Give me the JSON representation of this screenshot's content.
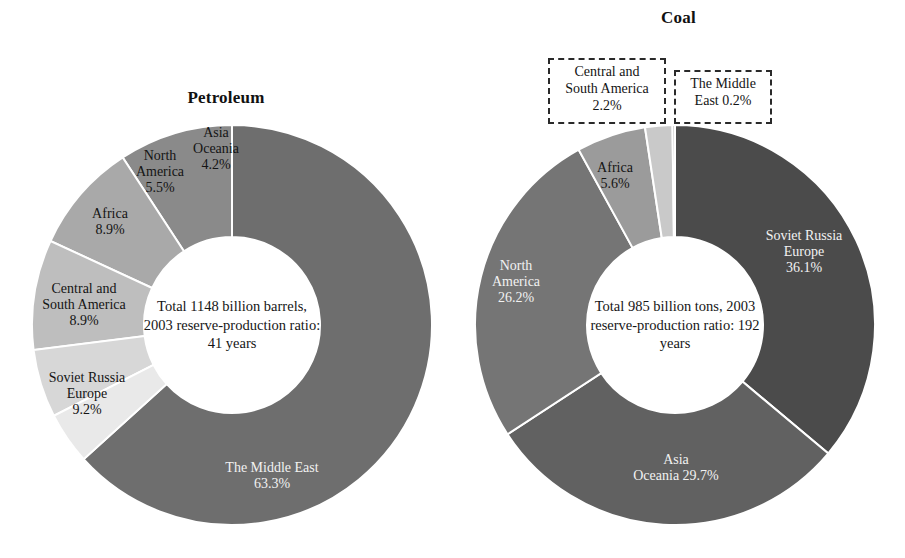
{
  "figure": {
    "background_color": "#ffffff",
    "text_color": "#141414"
  },
  "chart_data": [
    {
      "type": "pie",
      "variant": "donut",
      "title": "Petroleum",
      "unit": "percent of world reserves",
      "center_note": {
        "line1": "Total 1148 billion barrels,",
        "line2": "2003 reserve-production",
        "line3": "ratio: 41 years"
      },
      "total_label": "Total 1148 billion barrels",
      "total_value": 1148,
      "total_unit": "billion barrels",
      "reserve_production_ratio_year": 2003,
      "reserve_production_ratio_years": 41,
      "categories": [
        "The Middle East",
        "Soviet Russia Europe",
        "Central and South America",
        "Africa",
        "North America",
        "Asia Oceania"
      ],
      "values": [
        63.3,
        9.2,
        8.9,
        8.9,
        5.5,
        4.2
      ],
      "slices": [
        {
          "name": "The Middle East",
          "label_line1": "The Middle East",
          "label_line2": "63.3%",
          "value": 63.3,
          "color": "#6e6e6e",
          "label_color": "#f2f2f2"
        },
        {
          "name": "Soviet Russia Europe",
          "label_line1": "Soviet Russia",
          "label_line2": "Europe",
          "label_line3": "9.2%",
          "value": 9.2,
          "color": "#8a8a8a",
          "label_color": "#141414"
        },
        {
          "name": "Central and South America",
          "label_line1": "Central and",
          "label_line2": "South America",
          "label_line3": "8.9%",
          "value": 8.9,
          "color": "#a9a9a9",
          "label_color": "#141414"
        },
        {
          "name": "Africa",
          "label_line1": "Africa",
          "label_line2": "8.9%",
          "value": 8.9,
          "color": "#bebebe",
          "label_color": "#141414"
        },
        {
          "name": "North America",
          "label_line1": "North",
          "label_line2": "America",
          "label_line3": "5.5%",
          "value": 5.5,
          "color": "#d7d7d7",
          "label_color": "#141414"
        },
        {
          "name": "Asia Oceania",
          "label_line1": "Asia",
          "label_line2": "Oceania",
          "label_line3": "4.2%",
          "value": 4.2,
          "color": "#e9e9e9",
          "label_color": "#141414"
        }
      ]
    },
    {
      "type": "pie",
      "variant": "donut",
      "title": "Coal",
      "unit": "percent of world reserves",
      "center_note": {
        "line1": "Total 985 billion tons,",
        "line2": "2003 reserve-production",
        "line3": "ratio: 192 years"
      },
      "total_label": "Total 985 billion tons",
      "total_value": 985,
      "total_unit": "billion tons",
      "reserve_production_ratio_year": 2003,
      "reserve_production_ratio_years": 192,
      "categories": [
        "Soviet Russia Europe",
        "Asia Oceania",
        "North America",
        "Africa",
        "Central and South America",
        "The Middle East"
      ],
      "values": [
        36.1,
        29.7,
        26.2,
        5.6,
        2.2,
        0.2
      ],
      "slices": [
        {
          "name": "Soviet Russia Europe",
          "label_line1": "Soviet Russia",
          "label_line2": "Europe",
          "label_line3": "36.1%",
          "value": 36.1,
          "color": "#4b4b4b",
          "label_color": "#f2f2f2"
        },
        {
          "name": "Asia Oceania",
          "label_line1": "Asia",
          "label_line2": "Oceania 29.7%",
          "value": 29.7,
          "color": "#616161",
          "label_color": "#f2f2f2"
        },
        {
          "name": "North America",
          "label_line1": "North",
          "label_line2": "America",
          "label_line3": "26.2%",
          "value": 26.2,
          "color": "#757575",
          "label_color": "#f2f2f2"
        },
        {
          "name": "Africa",
          "label_line1": "Africa",
          "label_line2": "5.6%",
          "value": 5.6,
          "color": "#9b9b9b",
          "label_color": "#141414"
        },
        {
          "name": "Central and South America",
          "label_line1": "Central and",
          "label_line2": "South America",
          "label_line3": "2.2%",
          "value": 2.2,
          "color": "#c9c9c9",
          "label_color": "#141414",
          "callout": true
        },
        {
          "name": "The Middle East",
          "label_line1": "The Middle",
          "label_line2": "East 0.2%",
          "value": 0.2,
          "color": "#b0b0b0",
          "label_color": "#141414",
          "callout": true
        }
      ]
    }
  ]
}
